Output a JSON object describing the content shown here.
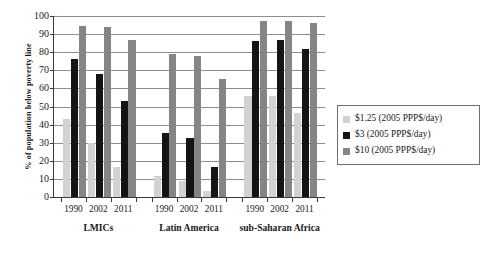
{
  "chart_data": {
    "type": "bar",
    "title": "",
    "xlabel": "",
    "ylabel": "% of population below poverty line",
    "ylim": [
      0,
      100
    ],
    "ytick_step": 10,
    "yticks": [
      0,
      10,
      20,
      30,
      40,
      50,
      60,
      70,
      80,
      90,
      100
    ],
    "grid": true,
    "legend_position": "right",
    "groups": [
      "LMICs",
      "Latin America",
      "sub-Saharan Africa"
    ],
    "categories": [
      "1990",
      "2002",
      "2011"
    ],
    "series": [
      {
        "name": "$1.25 (2005 PPP$/day)",
        "color": "#d2d2d2",
        "values_by_group": {
          "LMICs": [
            43,
            30,
            16.5
          ],
          "Latin America": [
            11.5,
            9,
            3.5
          ],
          "sub-Saharan Africa": [
            56,
            56,
            46.5
          ]
        }
      },
      {
        "name": "$3 (2005 PPP$/day)",
        "color": "#141414",
        "values_by_group": {
          "LMICs": [
            76,
            68,
            53
          ],
          "Latin America": [
            35.5,
            32.5,
            16.5
          ],
          "sub-Saharan Africa": [
            86,
            87,
            82
          ]
        }
      },
      {
        "name": "$10 (2005 PPP$/day)",
        "color": "#858585",
        "values_by_group": {
          "LMICs": [
            94.5,
            94,
            87
          ],
          "Latin America": [
            79,
            78,
            65
          ],
          "sub-Saharan Africa": [
            97,
            97.5,
            96
          ]
        }
      }
    ]
  },
  "axes": {
    "y_title": "% of population below poverty line",
    "y_tick_labels": [
      "0",
      "10",
      "20",
      "30",
      "40",
      "50",
      "60",
      "70",
      "80",
      "90",
      "100"
    ]
  },
  "legend": {
    "entries": [
      {
        "label": "$1.25 (2005 PPP$/day)",
        "color": "#d2d2d2"
      },
      {
        "label": "$3 (2005 PPP$/day)",
        "color": "#141414"
      },
      {
        "label": "$10 (2005 PPP$/day)",
        "color": "#858585"
      }
    ]
  }
}
